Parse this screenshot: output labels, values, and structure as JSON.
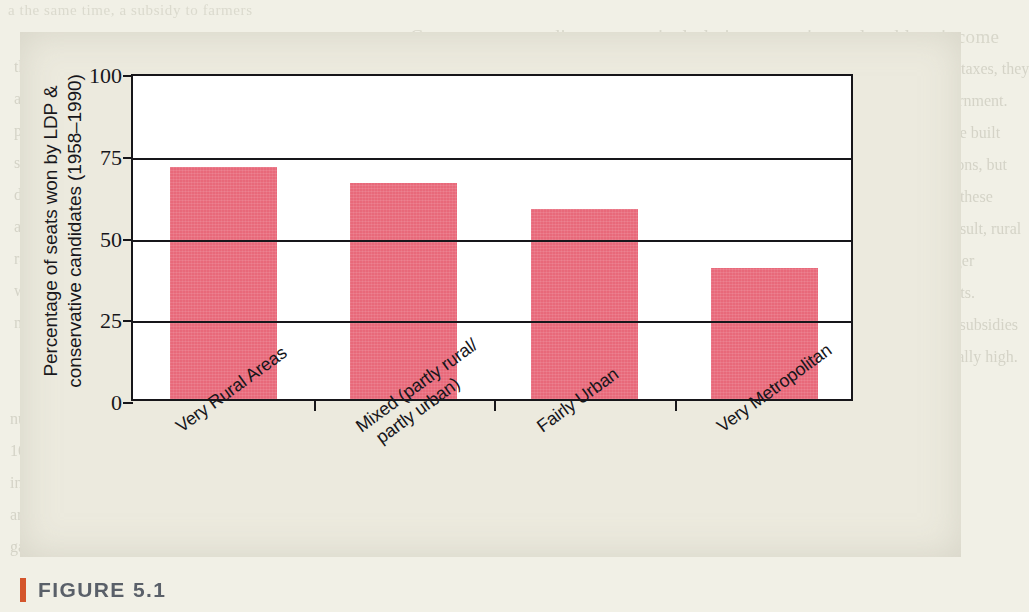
{
  "figure": {
    "caption": "FIGURE 5.1",
    "caption_accent_color": "#d4552c",
    "panel_background": "#eceade"
  },
  "chart_data": {
    "type": "bar",
    "title": "",
    "xlabel": "",
    "ylabel": "Percentage of seats won by LDP & conservative candidates (1958–1990)",
    "categories": [
      "Very Rural Areas",
      "Mixed (partly rural/\n  partly urban)",
      "Fairly Urban",
      "Very Metropolitan"
    ],
    "values": [
      71,
      66,
      58,
      40
    ],
    "ylim": [
      0,
      100
    ],
    "yticks": [
      0,
      25,
      50,
      75,
      100
    ],
    "ytick_labels": [
      "0",
      "25",
      "50",
      "75",
      "100"
    ],
    "grid": true,
    "legend": "none",
    "bar_color": "#e8697a",
    "axis_color": "#17161a",
    "plot_background": "#ffffff"
  },
  "page_bleed": {
    "top_line_1": "a the same time, a subsidy to farmers",
    "top_line_2": "Government spending was particularly important in rural and low-income",
    "right_lines": [
      "communities. While urban areas contributed more in taxes, they",
      "obtained proportionately less in return from the government.",
      "Post offices, schools, roads, bridges, and harbors were built",
      "throughout the countryside in part for economic reasons, but",
      "during election campaigns candidates made much of these",
      "policies as evidence of their ability to deliver. As a result, rural",
      "districts had both a greater number of seats and a larger",
      "number of voters per seat than their urban counterparts.",
      "Japanese agriculture also benefited from a variety of subsidies",
      "for rice and other products, which kept prices artificially high."
    ],
    "left_lines": [
      "the same time, a subsidy to farmers was",
      "an important source of support for the",
      "party in power. Under the electoral",
      "system in place until 1994, multi-member",
      "districts gave conservative candidates",
      "an advantage in rural areas where the",
      "ratio of representatives to constituents",
      "was considerably higher than in the",
      "metropolitan centers of the country."
    ],
    "bottom_lines": [
      "number of independent voters is now dramatically smaller. Nationally, less than",
      "10 percent of households are home-dwelling farm families, and in urban districts",
      "in the other hand, some voters respond positively to policies that bring urban",
      "areas rather infrastructure such as roads, bridges, and harbors, but such works",
      "gases have or become more additional government spending and social welfare"
    ]
  }
}
